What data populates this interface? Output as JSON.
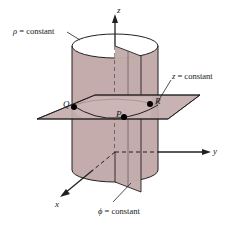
{
  "figure": {
    "colors": {
      "surface_fill": "#c3acab",
      "surface_fill_light": "#cbb6b5",
      "top_face": "#ffffff",
      "stroke": "#231f20",
      "text": "#18181a",
      "background": "#ffffff"
    },
    "axes": [
      {
        "id": "z",
        "label": "z",
        "x": 117,
        "y": 6
      },
      {
        "id": "y",
        "label": "y",
        "x": 213,
        "y": 149
      },
      {
        "id": "x",
        "label": "x",
        "x": 55,
        "y": 202
      }
    ],
    "points": [
      {
        "id": "Q",
        "label": "Q",
        "x": 63,
        "y": 103
      },
      {
        "id": "P",
        "label": "P",
        "x": 117,
        "y": 108
      },
      {
        "id": "R",
        "label": "R",
        "x": 155,
        "y": 101
      }
    ],
    "annotations": [
      {
        "id": "rho-constant",
        "symbol": "ρ",
        "text": " = constant",
        "x": 13,
        "y": 27
      },
      {
        "id": "z-constant",
        "symbol": "z",
        "text": " = constant",
        "x": 172,
        "y": 72
      },
      {
        "id": "phi-constant",
        "symbol": "ϕ",
        "text": " = constant",
        "x": 98,
        "y": 207
      }
    ]
  }
}
